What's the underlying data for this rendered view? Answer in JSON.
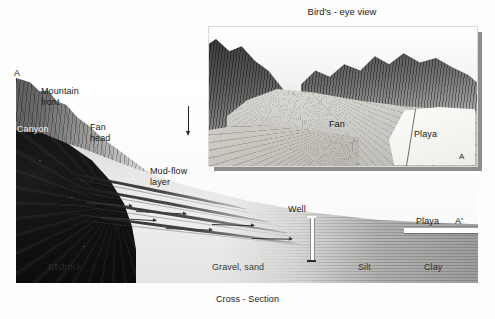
{
  "figure": {
    "caption_cross_section": "Cross - Section",
    "inset_title": "Bird's - eye view"
  },
  "cross_section": {
    "section_marker_left": "A",
    "section_marker_right": "A'",
    "labels": {
      "mountain_front": "Mountain\nfront",
      "canyon": "Canyon",
      "fan_head": "Fan\nhead",
      "mud_flow_layer": "Mud-flow\nlayer",
      "bedrock": "Bedrock",
      "gravel_sand": "Gravel, sand",
      "silt": "Silt",
      "clay": "Clay",
      "playa": "Playa",
      "well": "Well"
    }
  },
  "inset": {
    "labels": {
      "fan": "Fan",
      "playa": "Playa",
      "corner_marker": "A"
    }
  },
  "colors": {
    "bedrock": "#111111",
    "mud_flow": "#1e1e1e",
    "fan_fill": "#e6e6e4",
    "clay": "#969694",
    "playa_surface": "#ffffff",
    "inset_shadow": "#8d8d8d",
    "text": "#1b1b1b"
  }
}
